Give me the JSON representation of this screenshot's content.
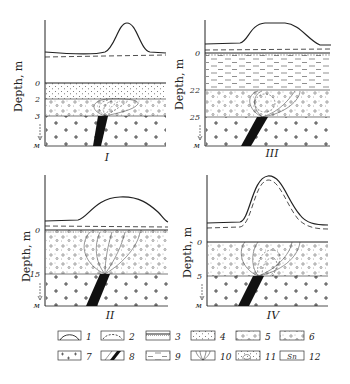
{
  "figure": {
    "y_axis_label": "Depth, m",
    "depth_arrow_label": "м",
    "panels": [
      {
        "id": "I",
        "roman": "I",
        "depth_ticks": [
          "0",
          "2",
          "3"
        ]
      },
      {
        "id": "III",
        "roman": "III",
        "depth_ticks": [
          "0",
          "22",
          "25"
        ]
      },
      {
        "id": "II",
        "roman": "II",
        "depth_ticks": [
          "0",
          "15"
        ]
      },
      {
        "id": "IV",
        "roman": "IV",
        "depth_ticks": [
          "0",
          "5"
        ]
      }
    ],
    "legend": [
      {
        "num": "1",
        "symbol": "solid-curve"
      },
      {
        "num": "2",
        "symbol": "dashed-curve"
      },
      {
        "num": "3",
        "symbol": "soil-surface-layer"
      },
      {
        "num": "4",
        "symbol": "fine-dotted-sediment"
      },
      {
        "num": "5",
        "symbol": "pebble-sediment"
      },
      {
        "num": "6",
        "symbol": "mixed-sediment"
      },
      {
        "num": "7",
        "symbol": "crystalline-basement-crosses"
      },
      {
        "num": "8",
        "symbol": "ore-vein-black"
      },
      {
        "num": "9",
        "symbol": "clay-dashes"
      },
      {
        "num": "10",
        "symbol": "dispersion-halo-lines"
      },
      {
        "num": "11",
        "symbol": "halo-in-sediment"
      },
      {
        "num": "12",
        "symbol": "metal-content-label"
      }
    ],
    "legend_box_12_text": "Sn"
  }
}
